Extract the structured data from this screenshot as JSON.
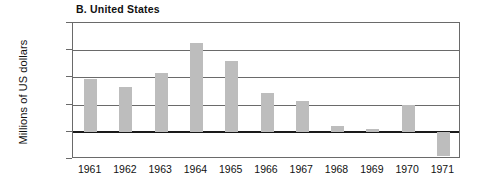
{
  "chart_data": {
    "type": "bar",
    "title": "B. United States",
    "xlabel": "",
    "ylabel": "Millions of US dollars",
    "categories": [
      "1961",
      "1962",
      "1963",
      "1964",
      "1965",
      "1966",
      "1967",
      "1968",
      "1969",
      "1970",
      "1971"
    ],
    "values": [
      3900,
      3300,
      4350,
      6500,
      5200,
      2850,
      2300,
      400,
      200,
      1950,
      -1800
    ],
    "ylim": [
      -2000,
      8000
    ],
    "yticks": [
      "8000",
      "6000",
      "4000",
      "2000",
      "0",
      "-2000"
    ],
    "ytick_values": [
      8000,
      6000,
      4000,
      2000,
      0,
      -2000
    ],
    "grid": true,
    "legend": "none",
    "series": [
      {
        "name": "United States",
        "values": [
          3900,
          3300,
          4350,
          6500,
          5200,
          2850,
          2300,
          400,
          200,
          1950,
          -1800
        ]
      }
    ],
    "colors": {
      "bar_fill": "#bdbdbd",
      "axis": "#6a6a6a",
      "zero_line": "#1a1a1a",
      "text": "#111111",
      "background": "#ffffff"
    }
  }
}
